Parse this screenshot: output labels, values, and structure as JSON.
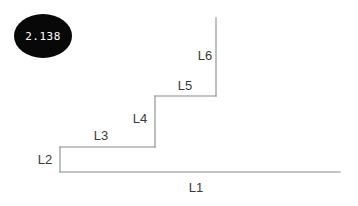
{
  "figure": {
    "type": "tree-diagram",
    "width": 358,
    "height": 206,
    "background_color": "#ffffff",
    "line_color": "#8a8a8a",
    "label_color": "#3a3a3a"
  },
  "badge": {
    "name": "score-badge",
    "value": "2.138",
    "shape": "ellipse",
    "fill_color": "#080808",
    "text_color": "#ffffff",
    "cx": 43,
    "cy": 36,
    "rx": 29,
    "ry": 22
  },
  "branches": [
    {
      "id": "L1",
      "label": "L1",
      "label_x": 196,
      "label_y": 192,
      "orientation": "horizontal",
      "x1": 60,
      "y1": 172,
      "x2": 340,
      "y2": 172
    },
    {
      "id": "L2",
      "label": "L2",
      "label_x": 45,
      "label_y": 164,
      "orientation": "vertical",
      "x1": 60,
      "y1": 147,
      "x2": 60,
      "y2": 172
    },
    {
      "id": "L3",
      "label": "L3",
      "label_x": 101,
      "label_y": 140,
      "orientation": "horizontal",
      "x1": 60,
      "y1": 147,
      "x2": 155,
      "y2": 147
    },
    {
      "id": "L4",
      "label": "L4",
      "label_x": 140,
      "label_y": 123,
      "orientation": "vertical",
      "x1": 155,
      "y1": 96,
      "x2": 155,
      "y2": 147
    },
    {
      "id": "L5",
      "label": "L5",
      "label_x": 185,
      "label_y": 90,
      "orientation": "horizontal",
      "x1": 155,
      "y1": 96,
      "x2": 216,
      "y2": 96
    },
    {
      "id": "L6",
      "label": "L6",
      "label_x": 205,
      "label_y": 60,
      "orientation": "vertical",
      "x1": 216,
      "y1": 18,
      "x2": 216,
      "y2": 96
    }
  ]
}
